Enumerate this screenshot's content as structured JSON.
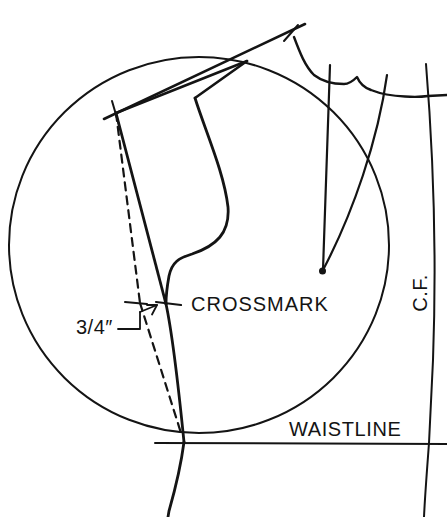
{
  "figure": {
    "background_color": "#ffffff",
    "ink_color": "#141414",
    "labels": {
      "crossmark": "CROSSMARK",
      "measurement": "3/4″",
      "center_front": "C.F.",
      "waistline": "WAISTLINE"
    },
    "markers": {
      "pivot_point": "star-crossmark",
      "dart_point": "filled-dot",
      "shoulder_tick": "cross-tick"
    }
  }
}
